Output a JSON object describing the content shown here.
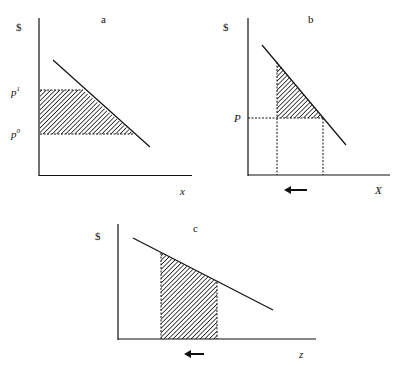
{
  "panels": [
    {
      "id": "a",
      "title": "a",
      "y_axis_label": "$",
      "x_axis_label": "x",
      "price_labels": [
        {
          "base": "p",
          "sup": "1"
        },
        {
          "base": "p",
          "sup": "0"
        }
      ],
      "shaded_region": "trapezoid between p1 and p0 under demand curve"
    },
    {
      "id": "b",
      "title": "b",
      "y_axis_label": "$",
      "x_axis_label": "X",
      "price_labels": [
        {
          "base": "P",
          "sup": ""
        }
      ],
      "arrow": "left-arrow",
      "shaded_region": "triangle above P under demand curve"
    },
    {
      "id": "c",
      "title": "c",
      "y_axis_label": "$",
      "x_axis_label": "z",
      "arrow": "left-arrow",
      "shaded_region": "area under demand curve between two quantities"
    }
  ],
  "colors": {
    "line": "#111111",
    "background": "#ffffff"
  }
}
